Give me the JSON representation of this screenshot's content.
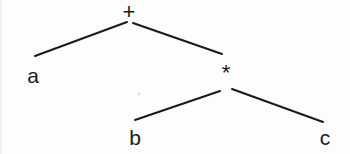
{
  "diagram": {
    "type": "binary-expression-tree",
    "expression": "a + b * c",
    "background_color": "#fdfdfd",
    "stroke_color": "#1a1a1a",
    "text_color": "#1a1a1a",
    "stroke_width": 2,
    "width": 350,
    "height": 154,
    "nodes": [
      {
        "id": "root",
        "label": "+",
        "kind": "operator",
        "x": 129,
        "y": 12,
        "font_size": 22
      },
      {
        "id": "leaf-a",
        "label": "a",
        "kind": "operand",
        "x": 33,
        "y": 75,
        "font_size": 21
      },
      {
        "id": "mul",
        "label": "*",
        "kind": "operator",
        "x": 226,
        "y": 73,
        "font_size": 22
      },
      {
        "id": "leaf-b",
        "label": "b",
        "kind": "operand",
        "x": 135,
        "y": 137,
        "font_size": 21
      },
      {
        "id": "leaf-c",
        "label": "c",
        "kind": "operand",
        "x": 325,
        "y": 137,
        "font_size": 21
      }
    ],
    "edges": [
      {
        "id": "edge-root-a",
        "from": "root",
        "to": "leaf-a",
        "x1": 127,
        "y1": 22,
        "x2": 35,
        "y2": 56
      },
      {
        "id": "edge-root-mul",
        "from": "root",
        "to": "mul",
        "x1": 133,
        "y1": 23,
        "x2": 222,
        "y2": 54
      },
      {
        "id": "edge-mul-b",
        "from": "mul",
        "to": "leaf-b",
        "x1": 220,
        "y1": 91,
        "x2": 135,
        "y2": 120
      },
      {
        "id": "edge-mul-c",
        "from": "mul",
        "to": "leaf-c",
        "x1": 232,
        "y1": 89,
        "x2": 323,
        "y2": 122
      }
    ],
    "artifacts": [
      {
        "id": "scan-speck",
        "x": 139,
        "y": 94
      }
    ]
  }
}
